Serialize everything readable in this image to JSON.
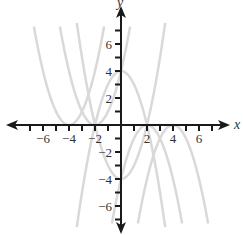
{
  "chart_data": {
    "type": "line",
    "title": "",
    "xlabel": "x",
    "ylabel": "y",
    "xlim": [
      -8,
      8
    ],
    "ylim": [
      -8,
      8
    ],
    "grid": false,
    "legend": null,
    "x_ticks": [
      -7,
      -6,
      -5,
      -4,
      -3,
      -2,
      -1,
      1,
      2,
      3,
      4,
      5,
      6,
      7
    ],
    "y_ticks": [
      -7,
      -6,
      -5,
      -4,
      -3,
      -2,
      -1,
      1,
      2,
      3,
      4,
      5,
      6,
      7
    ],
    "x_tick_labels": [
      {
        "value": -6,
        "text": "−6"
      },
      {
        "value": -4,
        "text": "−4"
      },
      {
        "value": -2,
        "text": "−2"
      },
      {
        "value": 2,
        "text": "2"
      },
      {
        "value": 4,
        "text": "4"
      },
      {
        "value": 6,
        "text": "6"
      }
    ],
    "y_tick_labels": [
      {
        "value": 6,
        "text": "6"
      },
      {
        "value": 4,
        "text": "4"
      },
      {
        "value": 2,
        "text": "2"
      },
      {
        "value": -2,
        "text": "−2"
      },
      {
        "value": -4,
        "text": "−4"
      },
      {
        "value": -6,
        "text": "−6"
      }
    ],
    "series": [
      {
        "name": "y = -x^2 + 4",
        "vertex": [
          0,
          4
        ],
        "a": -1,
        "h": 0,
        "k": 4,
        "x_range": [
          -3.4,
          3.4
        ],
        "color": "#d9d9d9"
      },
      {
        "name": "y = x^2 - 4",
        "vertex": [
          0,
          -4
        ],
        "a": 1,
        "h": 0,
        "k": -4,
        "x_range": [
          -3.4,
          3.4
        ],
        "color": "#d9d9d9"
      },
      {
        "name": "y = (x + 4)^2",
        "vertex": [
          -4,
          0
        ],
        "a": 1,
        "h": -4,
        "k": 0,
        "x_range": [
          -6.7,
          -1.3
        ],
        "color": "#d9d9d9"
      },
      {
        "name": "y = (x + 2)^2",
        "vertex": [
          -2,
          0
        ],
        "a": 1,
        "h": -2,
        "k": 0,
        "x_range": [
          -4.7,
          0.7
        ],
        "color": "#d9d9d9"
      },
      {
        "name": "y = -(x - 2)^2",
        "vertex": [
          2,
          0
        ],
        "a": -1,
        "h": 2,
        "k": 0,
        "x_range": [
          -0.7,
          4.7
        ],
        "color": "#d9d9d9"
      },
      {
        "name": "y = -(x - 4)^2",
        "vertex": [
          4,
          0
        ],
        "a": -1,
        "h": 4,
        "k": 0,
        "x_range": [
          1.3,
          6.7
        ],
        "color": "#d9d9d9"
      }
    ],
    "axis_color": "#1a1a1a"
  }
}
